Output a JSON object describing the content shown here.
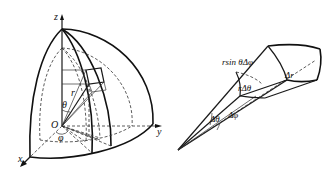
{
  "figure": {
    "left_panel": {
      "title": "Spherical coordinate system",
      "labels": {
        "z_axis": "z",
        "y_axis": "y",
        "x_axis": "x",
        "origin": "O",
        "radius": "r",
        "polar_angle": "θ",
        "azimuth_angle": "φ"
      }
    },
    "right_panel": {
      "title": "Volume element",
      "labels": {
        "arc_phi": "rsin θΔφ",
        "arc_theta": "rΔθ",
        "radial": "Δr",
        "delta_theta": "Δθ",
        "delta_phi": "Δφ"
      }
    }
  }
}
